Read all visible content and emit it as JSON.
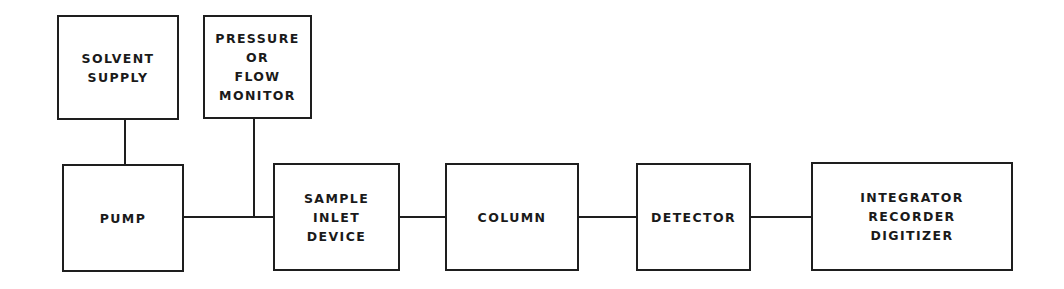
{
  "diagram": {
    "type": "block-flow-diagram",
    "blocks": [
      {
        "id": "solvent_supply",
        "label": "SOLVENT\nSUPPLY"
      },
      {
        "id": "pressure_monitor",
        "label": "PRESSURE\nOR\nFLOW\nMONITOR"
      },
      {
        "id": "pump",
        "label": "PUMP"
      },
      {
        "id": "sample_inlet",
        "label": "SAMPLE\nINLET\nDEVICE"
      },
      {
        "id": "column",
        "label": "COLUMN"
      },
      {
        "id": "detector",
        "label": "DETECTOR"
      },
      {
        "id": "integrator",
        "label": "INTEGRATOR\nRECORDER\nDIGITIZER"
      }
    ],
    "connections": [
      {
        "from": "solvent_supply",
        "to": "pump"
      },
      {
        "from": "pump",
        "to": "sample_inlet"
      },
      {
        "from": "pressure_monitor",
        "to": "pump-sample_inlet-line"
      },
      {
        "from": "sample_inlet",
        "to": "column"
      },
      {
        "from": "column",
        "to": "detector"
      },
      {
        "from": "detector",
        "to": "integrator"
      }
    ],
    "colors": {
      "line": "#1e1e1e",
      "background": "#ffffff"
    }
  }
}
